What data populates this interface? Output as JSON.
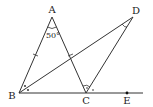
{
  "diagram": {
    "type": "geometry",
    "points": {
      "A": {
        "label": "A",
        "x": 52,
        "y": 17
      },
      "B": {
        "label": "B",
        "x": 19,
        "y": 93
      },
      "C": {
        "label": "C",
        "x": 86,
        "y": 93
      },
      "D": {
        "label": "D",
        "x": 133,
        "y": 17
      },
      "E": {
        "label": "E",
        "x": 127,
        "y": 93
      }
    },
    "segments": [
      "AB",
      "AC",
      "BD",
      "CD",
      "BE"
    ],
    "angle_label": "50°",
    "annotations": {
      "equal_ticks": [
        "AB",
        "AC"
      ],
      "bisected_angles": [
        "ABC",
        "ACE"
      ],
      "marked_angle": "D"
    },
    "colors": {
      "line": "#333333",
      "background": "#ffffff"
    }
  }
}
